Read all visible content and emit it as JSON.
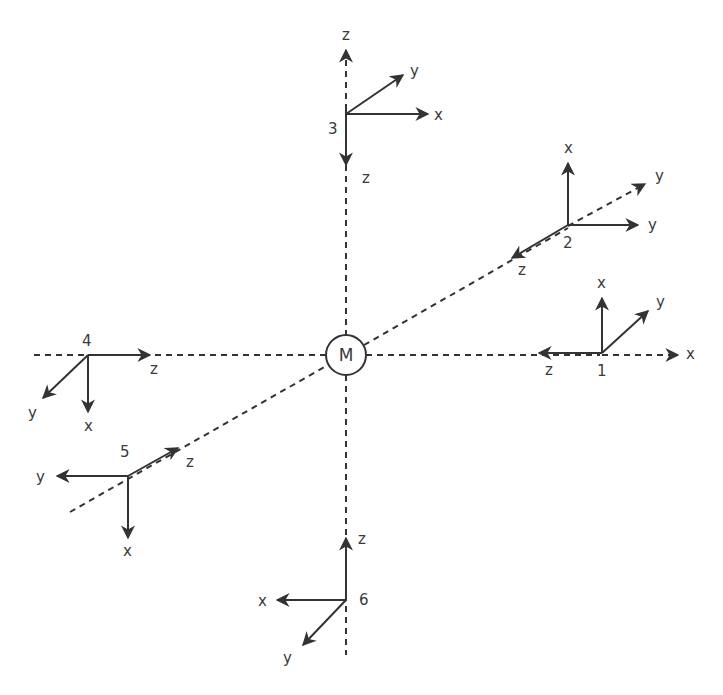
{
  "diagram": {
    "center_label": "M",
    "colors": {
      "line": "#333333",
      "text": "#3a3a3a"
    },
    "frames": [
      {
        "id": "1",
        "number": "1",
        "axes": {
          "up": "x",
          "left": "z",
          "diag": "y"
        },
        "dashed_axis": "x"
      },
      {
        "id": "2",
        "number": "2",
        "axes": {
          "up": "x",
          "right": "y",
          "down_left": "z"
        },
        "dashed_axis": "y"
      },
      {
        "id": "3",
        "number": "3",
        "axes": {
          "right": "x",
          "diag": "y",
          "down": "z"
        },
        "dashed_axis": "z"
      },
      {
        "id": "4",
        "number": "4",
        "axes": {
          "right": "z",
          "down": "x",
          "down_left": "y"
        }
      },
      {
        "id": "5",
        "number": "5",
        "axes": {
          "left": "y",
          "up_right": "z",
          "down": "x"
        }
      },
      {
        "id": "6",
        "number": "6",
        "axes": {
          "up": "z",
          "left": "x",
          "down_left": "y"
        }
      }
    ],
    "labels": {
      "f1_x": "x",
      "f1_y": "y",
      "f1_z": "z",
      "f1_dx": "x",
      "f1_n": "1",
      "f2_x": "x",
      "f2_y": "y",
      "f2_z": "z",
      "f2_dy": "y",
      "f2_n": "2",
      "f3_x": "x",
      "f3_y": "y",
      "f3_z": "z",
      "f3_dz": "z",
      "f3_n": "3",
      "f4_x": "x",
      "f4_y": "y",
      "f4_z": "z",
      "f4_n": "4",
      "f5_x": "x",
      "f5_y": "y",
      "f5_z": "z",
      "f5_n": "5",
      "f6_x": "x",
      "f6_y": "y",
      "f6_z": "z",
      "f6_n": "6"
    }
  }
}
